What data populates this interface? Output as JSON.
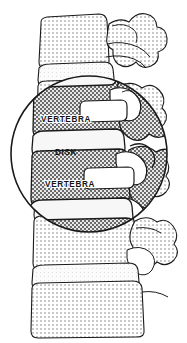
{
  "figure": {
    "background_color": "#ffffff",
    "width": 187,
    "height": 343
  },
  "palette": {
    "outline": "#1a1a1a",
    "bone_light": "#d9d9d9",
    "bone_dark": "#8c8c8c",
    "disk_light": "#f2f2f2",
    "nerve_white": "#ffffff",
    "label_text": "#141414",
    "magnifier_stroke": "#1a1a1a"
  },
  "labels": [
    {
      "id": "vertebra-upper",
      "text": "VERTEBRA",
      "x": 66,
      "y": 119,
      "size": 7.6,
      "color": "#141414"
    },
    {
      "id": "disk",
      "text": "DISK",
      "x": 66,
      "y": 152,
      "size": 7.6,
      "color": "#141414"
    },
    {
      "id": "vertebra-lower",
      "text": "VERTEBRA",
      "x": 70,
      "y": 184,
      "size": 7.6,
      "color": "#141414"
    }
  ],
  "magnifier": {
    "id": "magnification-circle",
    "center_x": 89,
    "center_y": 154,
    "radius": 78,
    "stroke_width": 1.6
  },
  "anatomy": {
    "vertebral_bodies": 5,
    "intervertebral_disks": 4,
    "spinous_processes": 4,
    "nerve_roots": 4,
    "view": "lateral / sagittal"
  }
}
